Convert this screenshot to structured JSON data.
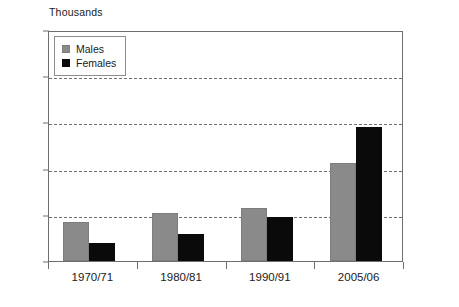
{
  "chart_data": {
    "type": "bar",
    "title": "",
    "subtitle": "",
    "unit_label": "Thousands",
    "xlabel": "",
    "ylabel": "",
    "ylim": [
      0,
      2500
    ],
    "ytick_values": [
      0,
      500,
      1000,
      1500,
      2000,
      2500
    ],
    "ytick_labels": [
      "0",
      "500",
      "1,000",
      "1,500",
      "2,000",
      "2,500"
    ],
    "grid": "horizontal-dashed",
    "legend_position": "top-left-inside",
    "categories": [
      "1970/71",
      "1980/81",
      "1990/91",
      "2005/06"
    ],
    "series": [
      {
        "name": "Males",
        "color": "#8a8a8a",
        "values": [
          420,
          520,
          575,
          1060
        ]
      },
      {
        "name": "Females",
        "color": "#0a0a0a",
        "values": [
          200,
          290,
          480,
          1450
        ]
      }
    ]
  },
  "legend": {
    "items": [
      {
        "label": "Males",
        "swatch": "males-swatch"
      },
      {
        "label": "Females",
        "swatch": "females-swatch"
      }
    ]
  }
}
